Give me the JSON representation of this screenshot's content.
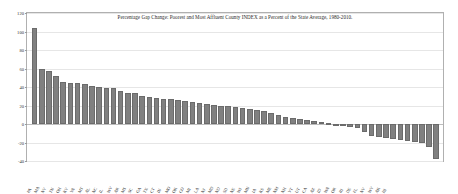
{
  "chart_data": {
    "type": "bar",
    "title": "Percentage Gap Change: Poorest and Most Affluent County INDEX as a Percent of the State Average, 1980-2010.",
    "xlabel": "",
    "ylabel": "",
    "ylim": [
      -40,
      120
    ],
    "yticks": [
      120,
      100,
      80,
      60,
      40,
      20,
      0,
      -20,
      -40
    ],
    "ytick_labels": [
      "120",
      "100",
      "80",
      "60",
      "40",
      "20",
      "0",
      "-20",
      "-40"
    ],
    "grid": true,
    "legend": "none",
    "bar_color": "#808080",
    "categories": [
      "PA",
      "MA",
      "NY",
      "TN",
      "OH",
      "KY",
      "VA",
      "MT",
      "AL",
      "NC",
      "IL",
      "WV",
      "AR",
      "MS",
      "SC",
      "GA",
      "TX",
      "CT",
      "IN",
      "MO",
      "OK",
      "CO",
      "MI",
      "LA",
      "NJ",
      "MD",
      "ND",
      "SD",
      "NE",
      "WI",
      "MN",
      "IA",
      "KS",
      "ME",
      "NM",
      "NH",
      "VT",
      "UT",
      "CA",
      "AZ",
      "ID",
      "WA",
      "OR",
      "RI",
      "DE",
      "FL",
      "NV",
      "WY",
      "AK",
      "HI"
    ],
    "values": [
      104,
      60,
      57,
      52,
      45,
      44,
      44,
      43,
      41,
      40,
      39,
      39,
      36,
      34,
      33,
      30,
      29,
      28,
      27,
      27,
      26,
      25,
      24,
      23,
      22,
      21,
      20,
      19,
      18,
      17,
      16,
      15,
      14,
      12,
      10,
      8,
      6,
      5,
      4,
      3,
      2,
      1,
      -1,
      -2,
      -3,
      -4,
      -9,
      -13,
      -14,
      -15
    ],
    "tail_values": [
      -16,
      -17,
      -18,
      -19,
      -21,
      -25,
      -38
    ]
  }
}
